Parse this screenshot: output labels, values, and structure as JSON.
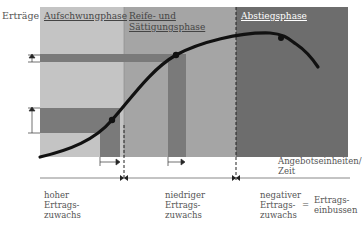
{
  "diagram": {
    "y_axis_label": "Erträge",
    "x_axis_label_line1": "Angebotseinheiten/",
    "x_axis_label_line2": "Zeit",
    "phases": [
      {
        "label_line1": "Aufschwungphase",
        "label_line2": "",
        "color": "#c4c4c4"
      },
      {
        "label_line1": "Reife- und",
        "label_line2": "Sättigungsphase",
        "color": "#a5a5a5"
      },
      {
        "label_line1": "Abstiegsphase",
        "label_line2": "",
        "color": "#6d6d6d"
      }
    ],
    "annotations": [
      {
        "line1": "hoher",
        "line2": "Ertrags-",
        "line3": "zuwachs"
      },
      {
        "line1": "niedriger",
        "line2": "Ertrags-",
        "line3": "zuwachs"
      },
      {
        "line1": "negativer",
        "line2": "Ertrags-",
        "line3": "zuwachs"
      }
    ],
    "equals_sign": "=",
    "result": {
      "line1": "Ertrags-",
      "line2": "einbussen"
    },
    "colors": {
      "dark_band": "#7a7a7a",
      "curve": "#111111",
      "text": "#555555",
      "phase3_label": "#ffffff"
    }
  }
}
